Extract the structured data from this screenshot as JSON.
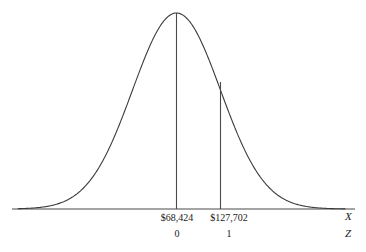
{
  "figure": {
    "title": "",
    "background_color": "#ffffff",
    "line_color": "#3c3c3c",
    "text_color": "#1a1a1a"
  },
  "axes": {
    "x_axis_name": "X",
    "z_axis_name": "Z",
    "baseline_y_px": 209,
    "x_start_px": 12,
    "x_end_px": 355
  },
  "labels": {
    "mean_x": "$68,424",
    "sigma_x": "$127,702",
    "mean_z": "0",
    "sigma_z": "1"
  },
  "chart_data": {
    "type": "line",
    "title": "",
    "xlabel": "X",
    "ylabel": "",
    "distribution": "normal",
    "mean": 68424,
    "std_dev": 59278,
    "x_tick_labels": [
      "$68,424",
      "$127,702"
    ],
    "z_tick_labels": [
      "0",
      "1"
    ],
    "x_tick_values": [
      68424,
      127702
    ],
    "z_tick_values": [
      0,
      1
    ],
    "markers": [
      {
        "label": "$68,424",
        "z": 0,
        "x_px": 176.5,
        "line_top_px": 13,
        "line_bottom_px": 209
      },
      {
        "label": "$127,702",
        "z": 1,
        "x_px": 220.5,
        "line_top_px": 82,
        "line_bottom_px": 209
      }
    ],
    "curve": {
      "peak_x_px": 176.5,
      "peak_y_px": 13,
      "baseline_y_px": 209,
      "sigma_px": 44,
      "left_px": 18,
      "right_px": 345
    },
    "grid": false,
    "legend": null
  }
}
